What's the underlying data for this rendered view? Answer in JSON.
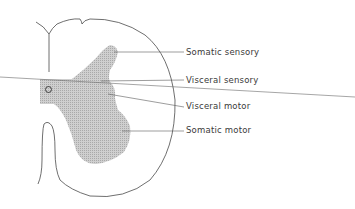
{
  "labels": [
    {
      "id": "somatic-sensory",
      "text": "Somatic sensory",
      "x": 186,
      "y": 47
    },
    {
      "id": "visceral-sensory",
      "text": "Visceral sensory",
      "x": 186,
      "y": 75
    },
    {
      "id": "visceral-motor",
      "text": "Visceral motor",
      "x": 186,
      "y": 101
    },
    {
      "id": "somatic-motor",
      "text": "Somatic motor",
      "x": 186,
      "y": 125
    }
  ],
  "colors": {
    "outline": "#4a4a4a",
    "gray_matter": "#c4c4c4",
    "leader": "#5a5a5a",
    "text": "#3a3a3a"
  }
}
